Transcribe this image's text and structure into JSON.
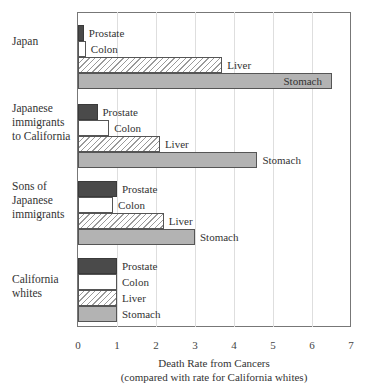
{
  "chart_data": {
    "type": "bar",
    "orientation": "horizontal",
    "title": "",
    "xlabel": "Death Rate from Cancers",
    "xlabel_sub": "(compared with rate for California whites)",
    "ylabel": "",
    "xlim": [
      0,
      7
    ],
    "xticks": [
      "0",
      "1",
      "2",
      "3",
      "4",
      "5",
      "6",
      "7"
    ],
    "grid": "vertical",
    "legend": "inline bar labels",
    "categories": [
      "Japan",
      "Japanese immigrants to California",
      "Sons of Japanese immigrants",
      "California whites"
    ],
    "category_lines": [
      [
        "Japan"
      ],
      [
        "Japanese",
        "immigrants",
        "to California"
      ],
      [
        "Sons of",
        "Japanese",
        "immigrants"
      ],
      [
        "California",
        "whites"
      ]
    ],
    "series": [
      {
        "name": "Prostate",
        "values": [
          0.15,
          0.5,
          1.0,
          1.0
        ],
        "color": "#4a4a4a",
        "pattern": "solid-dark"
      },
      {
        "name": "Colon",
        "values": [
          0.2,
          0.8,
          0.9,
          1.0
        ],
        "color": "#ffffff",
        "pattern": "white"
      },
      {
        "name": "Liver",
        "values": [
          3.7,
          2.1,
          2.2,
          1.0
        ],
        "color": "#ffffff",
        "pattern": "diagonal-hatch"
      },
      {
        "name": "Stomach",
        "values": [
          6.5,
          4.6,
          3.0,
          1.0
        ],
        "color": "#b3b3b3",
        "pattern": "solid-gray"
      }
    ],
    "annotations": [
      "Stomach label for Japan drawn inside bar"
    ]
  }
}
